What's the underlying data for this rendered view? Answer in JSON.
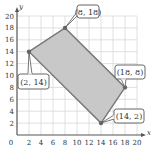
{
  "chart_data": {
    "type": "area",
    "title": "",
    "xlabel": "x",
    "ylabel": "y",
    "xlim": [
      0,
      20
    ],
    "ylim": [
      0,
      20
    ],
    "grid": true,
    "x_ticks": [
      0,
      2,
      4,
      6,
      8,
      10,
      12,
      14,
      16,
      18,
      20
    ],
    "y_ticks": [
      2,
      4,
      6,
      8,
      10,
      12,
      14,
      16,
      18,
      20
    ],
    "polygon": {
      "name": "feasible region",
      "fill": "#c8c8c8",
      "stroke": "#777777",
      "vertices": [
        {
          "x": 2,
          "y": 14,
          "label": "(2, 14)"
        },
        {
          "x": 8,
          "y": 18,
          "label": "(8, 18)"
        },
        {
          "x": 18,
          "y": 8,
          "label": "(18, 8)"
        },
        {
          "x": 14,
          "y": 2,
          "label": "(14, 2)"
        }
      ]
    },
    "annotations": [
      "(2, 14)",
      "(8, 18)",
      "(18, 8)",
      "(14, 2)"
    ]
  },
  "colors": {
    "grid": "#d8d8d8",
    "axis": "#555555",
    "fill": "#c8c8c8",
    "edge": "#777777",
    "vertex": "#666666",
    "label_border": "#555555"
  },
  "layout": {
    "origin_px": [
      17,
      135
    ],
    "px_per_unit_x": 6.0,
    "px_per_unit_y": 5.95,
    "label_boxes": [
      {
        "x": 18,
        "y": 74,
        "w": 31,
        "h": 15,
        "pointer_to": 0
      },
      {
        "x": 77,
        "y": 5,
        "w": 22,
        "h": 13,
        "pointer_to": 1
      },
      {
        "x": 115,
        "y": 65,
        "w": 30,
        "h": 14,
        "pointer_to": 2
      },
      {
        "x": 114,
        "y": 109,
        "w": 30,
        "h": 14,
        "pointer_to": 3
      }
    ]
  }
}
